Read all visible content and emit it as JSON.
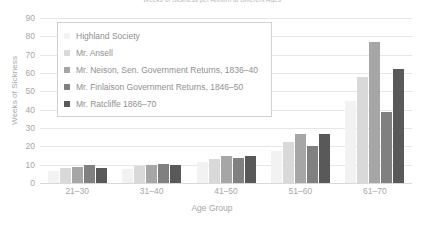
{
  "chart_data": {
    "type": "bar",
    "title": "Weeks of Sickness per Annum at Different Ages",
    "xlabel": "Age Group",
    "ylabel": "Weeks of Sickness",
    "categories": [
      "21–30",
      "31–40",
      "41–50",
      "51–60",
      "61–70"
    ],
    "ylim": [
      0,
      90
    ],
    "yticks": [
      0,
      10,
      20,
      30,
      40,
      50,
      60,
      70,
      80,
      90
    ],
    "grid": true,
    "legend_position": "upper-left-inside",
    "series": [
      {
        "name": "Highland Society",
        "color": "#f2f2f2",
        "values": [
          6.5,
          7.5,
          11.5,
          17.5,
          45
        ]
      },
      {
        "name": "Mr. Ansell",
        "color": "#d9d9d9",
        "values": [
          8,
          9.5,
          13,
          22.5,
          58
        ]
      },
      {
        "name": "Mr. Neison, Sen. Government Returns, 1836–40",
        "color": "#a6a6a6",
        "values": [
          9,
          10,
          15,
          27,
          77
        ]
      },
      {
        "name": "Mr. Finlaison Government Returns, 1846–50",
        "color": "#808080",
        "values": [
          10,
          10.5,
          13.5,
          20,
          39
        ]
      },
      {
        "name": "Mr. Ratcliffe 1866–70",
        "color": "#595959",
        "values": [
          8,
          10,
          15,
          27,
          62
        ]
      }
    ]
  }
}
